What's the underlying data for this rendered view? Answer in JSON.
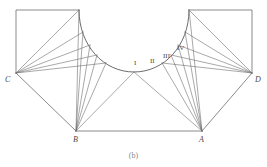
{
  "figure": {
    "caption": "(b)",
    "stroke_color": "#595959",
    "background_color": "#ffffff",
    "label_color": "#4a4a4a",
    "vertex_labels": [
      {
        "id": "C",
        "text": "C",
        "x": 5,
        "y": 76
      },
      {
        "id": "D",
        "text": "D",
        "x": 255,
        "y": 76
      },
      {
        "id": "B",
        "text": "B",
        "x": 73,
        "y": 136
      },
      {
        "id": "A",
        "text": "A",
        "x": 199,
        "y": 136
      }
    ],
    "arc_labels": [
      {
        "id": "I",
        "text": "I",
        "x": 134,
        "y": 60
      },
      {
        "id": "II",
        "text": "II",
        "x": 150,
        "y": 58
      },
      {
        "id": "III",
        "text": "III",
        "x": 163,
        "y": 53
      },
      {
        "id": "IV",
        "text": "IV",
        "x": 177,
        "y": 45
      }
    ],
    "geometry": {
      "left_rect": "M 16,73 L 16,10 L 79,10",
      "right_rect": "M 252,73 L 252,10 L 189,10",
      "arc": "M 79,10 C 79,46 104,72 134,72 C 164,72 189,46 189,10",
      "baseline": "M 76,131 L 202,131",
      "edge_c_b": "M 16,73 L 76,131",
      "edge_d_a": "M 252,73 L 202,131",
      "fan_C": [
        "M 16,73 L 79,10",
        "M 16,73 L 83,32",
        "M 16,73 L 90,45",
        "M 16,73 L 97,55",
        "M 16,73 L 106,63"
      ],
      "fan_B": [
        "M 76,131 L 79,10",
        "M 76,131 L 83,32",
        "M 76,131 L 90,45",
        "M 76,131 L 97,55",
        "M 76,131 L 106,63",
        "M 76,131 L 134,72"
      ],
      "fan_A": [
        "M 202,131 L 189,10",
        "M 202,131 L 185,32",
        "M 202,131 L 178,45",
        "M 202,131 L 171,55",
        "M 202,131 L 162,63",
        "M 202,131 L 134,72"
      ],
      "fan_D": [
        "M 252,73 L 189,10",
        "M 252,73 L 185,32",
        "M 252,73 L 178,45",
        "M 252,73 L 171,55",
        "M 252,73 L 162,63"
      ]
    }
  }
}
